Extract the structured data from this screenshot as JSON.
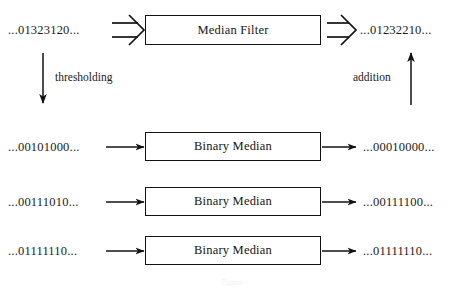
{
  "figure": {
    "caption": "Figure"
  },
  "top_row": {
    "input_signal": "...01323120...",
    "process_label": "Median Filter",
    "output_signal": "...01232210...",
    "input_arrow_icon": "double-arrow-right-icon",
    "output_arrow_icon": "double-arrow-right-icon"
  },
  "operations": {
    "thresholding_label": "thresholding",
    "thresholding_arrow_icon": "arrow-down-icon",
    "addition_label": "addition",
    "addition_arrow_icon": "arrow-up-icon"
  },
  "binary_rows": [
    {
      "input_signal": "...00101000...",
      "process_label": "Binary Median",
      "output_signal": "...00010000...",
      "input_arrow_icon": "arrow-right-icon",
      "output_arrow_icon": "arrow-right-icon"
    },
    {
      "input_signal": "...00111010...",
      "process_label": "Binary Median",
      "output_signal": "...00111100...",
      "input_arrow_icon": "arrow-right-icon",
      "output_arrow_icon": "arrow-right-icon"
    },
    {
      "input_signal": "...01111110...",
      "process_label": "Binary Median",
      "output_signal": "...01111110...",
      "input_arrow_icon": "arrow-right-icon",
      "output_arrow_icon": "arrow-right-icon"
    }
  ],
  "colors": {
    "ink": "#121212",
    "background": "#ffffff"
  }
}
